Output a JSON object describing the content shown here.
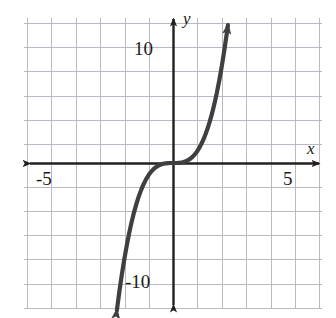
{
  "figure": {
    "name": "cubic-function-graph",
    "background_color": "#ffffff",
    "width": 336,
    "height": 318
  },
  "axes": {
    "x_axis_label": "x",
    "y_axis_label": "y",
    "axis_color": "#231f20",
    "grid_color": "#b9b9c4",
    "origin_px": {
      "x": 173,
      "y": 163
    },
    "px_per_grid_x": 24.4,
    "px_per_grid_y": 24.2,
    "units_per_grid_x": 1,
    "units_per_grid_y": 2,
    "x_axis_arrow_left_px": 23,
    "x_axis_arrow_right_px": 325,
    "y_axis_arrow_top_px": 13,
    "y_axis_arrow_bottom_px": 312
  },
  "ticks": {
    "x": [
      {
        "label": "-5",
        "value": -5
      },
      {
        "label": "5",
        "value": 5
      }
    ],
    "y": [
      {
        "label": "10",
        "value": 10
      },
      {
        "label": "-10",
        "value": -10
      }
    ]
  },
  "chart_data": {
    "type": "line",
    "title": "",
    "xlabel": "x",
    "ylabel": "y",
    "xlim": [
      -6.1,
      6.2
    ],
    "ylim": [
      -12.3,
      12.4
    ],
    "grid": true,
    "legend": "none",
    "series": [
      {
        "name": "y = x^3",
        "expression": "y = x^3",
        "color": "#3f3f3f",
        "line_width_px": 4,
        "arrow_start": true,
        "arrow_end": true,
        "x": [
          -2.3,
          -2.2,
          -2.1,
          -2.0,
          -1.9,
          -1.8,
          -1.7,
          -1.6,
          -1.5,
          -1.4,
          -1.3,
          -1.2,
          -1.1,
          -1.0,
          -0.9,
          -0.8,
          -0.7,
          -0.6,
          -0.5,
          -0.4,
          -0.3,
          -0.2,
          -0.1,
          0.0,
          0.1,
          0.2,
          0.3,
          0.4,
          0.5,
          0.6,
          0.7,
          0.8,
          0.9,
          1.0,
          1.1,
          1.2,
          1.3,
          1.4,
          1.5,
          1.6,
          1.7,
          1.8,
          1.9,
          2.0,
          2.1,
          2.2,
          2.25
        ],
        "y": [
          -12.17,
          -10.65,
          -9.26,
          -8.0,
          -6.86,
          -5.83,
          -4.91,
          -4.1,
          -3.38,
          -2.74,
          -2.2,
          -1.73,
          -1.33,
          -1.0,
          -0.73,
          -0.51,
          -0.34,
          -0.22,
          -0.13,
          -0.06,
          -0.03,
          -0.01,
          0.0,
          0.0,
          0.0,
          0.01,
          0.03,
          0.06,
          0.13,
          0.22,
          0.34,
          0.51,
          0.73,
          1.0,
          1.33,
          1.73,
          2.2,
          2.74,
          3.38,
          4.1,
          4.91,
          5.83,
          6.86,
          8.0,
          9.26,
          10.65,
          11.39
        ]
      }
    ],
    "annotations": [],
    "x_ticks": [
      -5,
      5
    ],
    "y_ticks": [
      -10,
      10
    ],
    "x_gridlines": [
      -6,
      -5,
      -4,
      -3,
      -2,
      -1,
      0,
      1,
      2,
      3,
      4,
      5,
      6
    ],
    "y_gridlines": [
      -12,
      -10,
      -8,
      -6,
      -4,
      -2,
      0,
      2,
      4,
      6,
      8,
      10,
      12
    ]
  }
}
